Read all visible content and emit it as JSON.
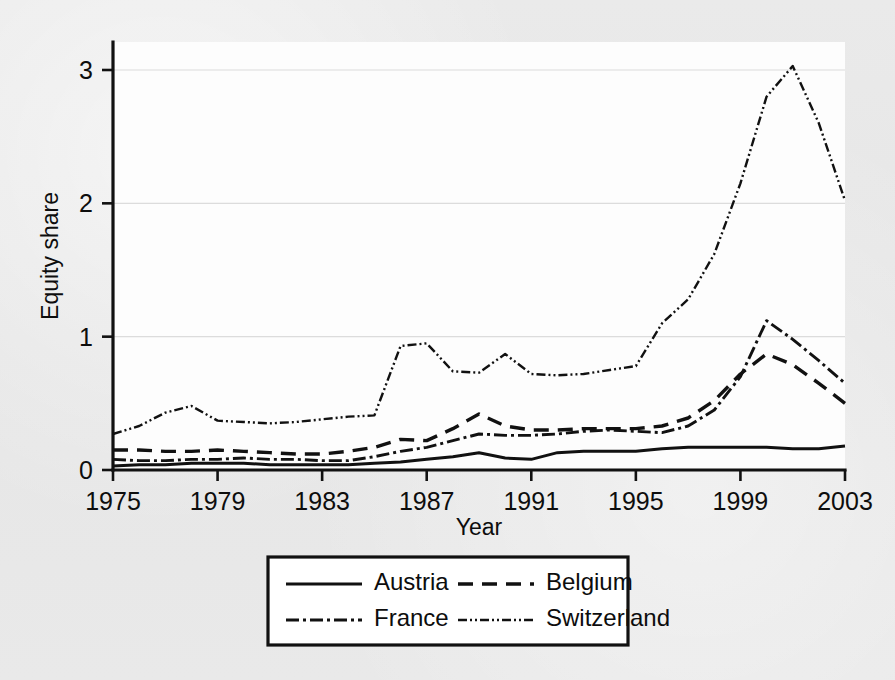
{
  "figure": {
    "background_color": "#e8e8e8",
    "plot_background_color": "#fdfdfd",
    "ink_color": "#111111",
    "grid_color": "#dcdcdc"
  },
  "chart_data": {
    "type": "line",
    "title": "",
    "subtitle": "",
    "xlabel": "Year",
    "ylabel": "Equity share",
    "xlim": [
      1975,
      2003
    ],
    "ylim": [
      0,
      3.15
    ],
    "xticks": [
      1975,
      1979,
      1983,
      1987,
      1991,
      1995,
      1999,
      2003
    ],
    "xtick_labels": [
      "1975",
      "1979",
      "1983",
      "1987",
      "1991",
      "1995",
      "1999",
      "2003"
    ],
    "yticks": [
      0,
      1,
      2,
      3
    ],
    "ytick_labels": [
      "0",
      "1",
      "2",
      "3"
    ],
    "grid": "horizontal",
    "legend_position": "below-outside",
    "legend_entries": [
      "Austria",
      "Belgium",
      "France",
      "Switzerland"
    ],
    "x": [
      1975,
      1976,
      1977,
      1978,
      1979,
      1980,
      1981,
      1982,
      1983,
      1984,
      1985,
      1986,
      1987,
      1988,
      1989,
      1990,
      1991,
      1992,
      1993,
      1994,
      1995,
      1996,
      1997,
      1998,
      1999,
      2000,
      2001,
      2002,
      2003
    ],
    "series": [
      {
        "name": "Austria",
        "style": "solid",
        "values": [
          0.03,
          0.04,
          0.04,
          0.05,
          0.05,
          0.05,
          0.04,
          0.04,
          0.04,
          0.04,
          0.05,
          0.06,
          0.08,
          0.1,
          0.13,
          0.09,
          0.08,
          0.13,
          0.14,
          0.14,
          0.14,
          0.16,
          0.17,
          0.17,
          0.17,
          0.17,
          0.16,
          0.16,
          0.18
        ]
      },
      {
        "name": "Belgium",
        "style": "dashed",
        "values": [
          0.15,
          0.15,
          0.14,
          0.14,
          0.15,
          0.14,
          0.13,
          0.12,
          0.12,
          0.14,
          0.17,
          0.23,
          0.22,
          0.31,
          0.42,
          0.33,
          0.3,
          0.3,
          0.31,
          0.31,
          0.31,
          0.33,
          0.39,
          0.52,
          0.72,
          0.87,
          0.79,
          0.65,
          0.5
        ]
      },
      {
        "name": "France",
        "style": "dash-dot",
        "values": [
          0.08,
          0.07,
          0.07,
          0.08,
          0.08,
          0.09,
          0.08,
          0.08,
          0.07,
          0.07,
          0.1,
          0.14,
          0.17,
          0.22,
          0.27,
          0.26,
          0.26,
          0.27,
          0.29,
          0.3,
          0.29,
          0.28,
          0.33,
          0.45,
          0.7,
          1.12,
          0.98,
          0.82,
          0.65
        ]
      },
      {
        "name": "Switzerland",
        "style": "dash-dot-dot",
        "values": [
          0.27,
          0.33,
          0.43,
          0.48,
          0.37,
          0.36,
          0.35,
          0.36,
          0.38,
          0.4,
          0.41,
          0.93,
          0.95,
          0.74,
          0.73,
          0.87,
          0.72,
          0.71,
          0.72,
          0.75,
          0.78,
          1.1,
          1.28,
          1.62,
          2.15,
          2.8,
          3.03,
          2.6,
          2.02
        ]
      }
    ]
  }
}
